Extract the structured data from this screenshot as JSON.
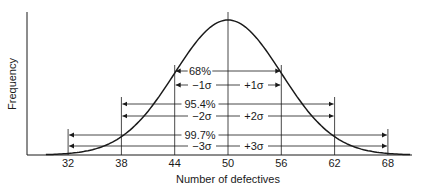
{
  "chart_data": {
    "type": "line",
    "title": "",
    "xlabel": "Number of defectives",
    "ylabel": "Frequency",
    "xlim": [
      30,
      72
    ],
    "x_ticks": [
      32,
      38,
      44,
      50,
      56,
      62,
      68
    ],
    "x_tick_labels": [
      "32",
      "38",
      "44",
      "50",
      "56",
      "62",
      "68"
    ],
    "grid": false,
    "legend": null,
    "series": [
      {
        "name": "Normal distribution",
        "mean": 50,
        "sigma": 6
      }
    ],
    "annotations": [
      {
        "label": "68%",
        "lower": "−1σ",
        "upper": "+1σ",
        "range": [
          44,
          56
        ]
      },
      {
        "label": "95.4%",
        "lower": "−2σ",
        "upper": "+2σ",
        "range": [
          38,
          62
        ]
      },
      {
        "label": "99.7%",
        "lower": "−3σ",
        "upper": "+3σ",
        "range": [
          32,
          68
        ]
      }
    ]
  },
  "colors": {
    "ink": "#1a1a1a",
    "background": "#ffffff"
  }
}
